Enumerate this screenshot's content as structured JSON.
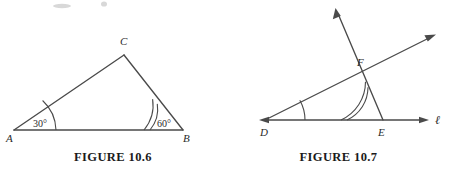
{
  "sheet": {
    "background_color": "#ffffff",
    "ink_color": "#4a4a4a",
    "text_color": "#2a2a2a"
  },
  "figures": [
    {
      "id": "figure-10-6",
      "caption": "FIGURE 10.6",
      "description": "Triangle ABC with angle A marked 30 degrees and angle B marked 60 degrees",
      "vertices": [
        {
          "name": "A",
          "label": "A",
          "x": 14,
          "y": 130
        },
        {
          "name": "B",
          "label": "B",
          "x": 183,
          "y": 130
        },
        {
          "name": "C",
          "label": "C",
          "x": 124,
          "y": 55
        }
      ],
      "vertex_labels": [
        {
          "name": "A",
          "label": "A",
          "x": 6,
          "y": 142
        },
        {
          "name": "B",
          "label": "B",
          "x": 183,
          "y": 142
        },
        {
          "name": "C",
          "label": "C",
          "x": 120,
          "y": 45
        }
      ],
      "angles": [
        {
          "at": "A",
          "label": "30°",
          "value": 30,
          "arcs": 1,
          "label_x": 33,
          "label_y": 127
        },
        {
          "at": "B",
          "label": "60°",
          "value": 60,
          "arcs": 2,
          "label_x": 157,
          "label_y": 127
        }
      ]
    },
    {
      "id": "figure-10-7",
      "caption": "FIGURE 10.7",
      "description": "Line l with points D and E, a ray from D through F, and a transversal ray through F and E",
      "line_label": "ℓ",
      "line_label_x": 199,
      "line_label_y": 124,
      "vertices": [
        {
          "name": "D",
          "label": "D",
          "x": 39,
          "y": 120
        },
        {
          "name": "E",
          "label": "E",
          "x": 157,
          "y": 120
        },
        {
          "name": "F",
          "label": "F",
          "x": 137,
          "y": 78
        }
      ],
      "vertex_labels": [
        {
          "name": "D",
          "label": "D",
          "x": 34,
          "y": 136
        },
        {
          "name": "E",
          "label": "E",
          "x": 152,
          "y": 136
        },
        {
          "name": "F",
          "label": "F",
          "x": 131,
          "y": 66
        }
      ],
      "angles": [
        {
          "at": "D",
          "label": "",
          "arcs": 1
        },
        {
          "at": "E",
          "label": "",
          "arcs": 2
        }
      ]
    }
  ]
}
